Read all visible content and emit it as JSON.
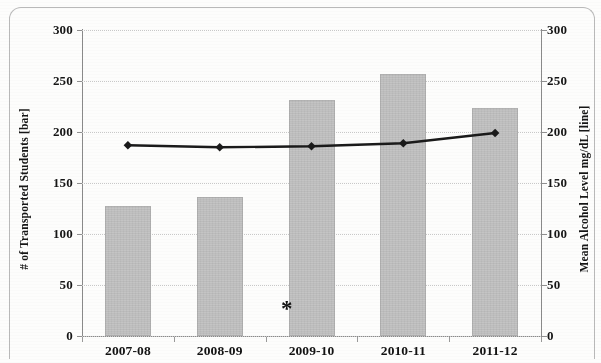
{
  "chart_data": {
    "type": "bar",
    "title": "",
    "categories": [
      "2007-08",
      "2008-09",
      "2009-10",
      "2010-11",
      "2011-12"
    ],
    "xlabel": "",
    "ylabel": "# of Transported Students [bar]",
    "y2label": "Mean Alcohol Level mg/dL [line]",
    "ylim": [
      0,
      300
    ],
    "y2lim": [
      0,
      300
    ],
    "yticks": [
      0,
      50,
      100,
      150,
      200,
      250,
      300
    ],
    "y2ticks": [
      0,
      50,
      100,
      150,
      200,
      250,
      300
    ],
    "grid": true,
    "legend": "none",
    "series": [
      {
        "name": "# of Transported Students",
        "render": "bar",
        "axis": "left",
        "color": "#c4c4c4",
        "values": [
          127,
          136,
          231,
          257,
          224
        ]
      },
      {
        "name": "Mean Alcohol Level mg/dL",
        "render": "line",
        "axis": "right",
        "color": "#1a1a1a",
        "marker": "diamond",
        "values": [
          187,
          185,
          186,
          189,
          199
        ]
      }
    ],
    "annotations": [
      {
        "text": "*",
        "x_category_between": [
          "2008-09",
          "2009-10"
        ],
        "y": 14
      }
    ]
  },
  "axes": {
    "left": {
      "title": "# of Transported Students [bar]",
      "tick_labels": [
        "300",
        "250",
        "200",
        "150",
        "100",
        "50",
        "0"
      ]
    },
    "right": {
      "title": "Mean Alcohol Level mg/dL [line]",
      "tick_labels": [
        "300",
        "250",
        "200",
        "150",
        "100",
        "50",
        "0"
      ]
    },
    "bottom": {
      "tick_labels": [
        "2007-08",
        "2008-09",
        "2009-10",
        "2010-11",
        "2011-12"
      ]
    }
  },
  "annotation": {
    "asterisk": "*"
  }
}
